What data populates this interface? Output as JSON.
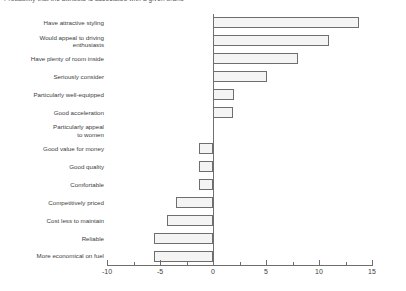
{
  "chart_data": {
    "type": "bar",
    "orientation": "horizontal",
    "title": "Probability that the attribute is associated with a given brand",
    "xlabel": "",
    "ylabel": "",
    "xlim": [
      -10,
      15
    ],
    "xticks": [
      -10,
      -5,
      0,
      5,
      10,
      15
    ],
    "xtick_labels": [
      "-10",
      "-5",
      "0",
      "5",
      "10",
      "15"
    ],
    "minor_ticks": [
      -7.5,
      -2.5,
      2.5,
      7.5,
      12.5
    ],
    "grid": false,
    "legend": "none",
    "bar_fill_color": "#f4f4f4",
    "bar_border_color": "#6e6e6e",
    "axis_color": "#6e6e6e",
    "categories": [
      "Have attractive styling",
      "Would appeal to driving\nenthusiasts",
      "Have plenty of room inside",
      "Seriously consider",
      "Particularly well-equipped",
      "Good acceleration",
      "Particularly appeal\nto women",
      "Good value for money",
      "Good quality",
      "Comfortable",
      "Competitively priced",
      "Cost less to maintain",
      "Reliable",
      "More economical on fuel"
    ],
    "values": [
      13.8,
      10.9,
      8.0,
      5.1,
      2.0,
      1.9,
      0.0,
      -1.3,
      -1.3,
      -1.3,
      -3.5,
      -4.3,
      -5.6,
      -5.6
    ]
  }
}
